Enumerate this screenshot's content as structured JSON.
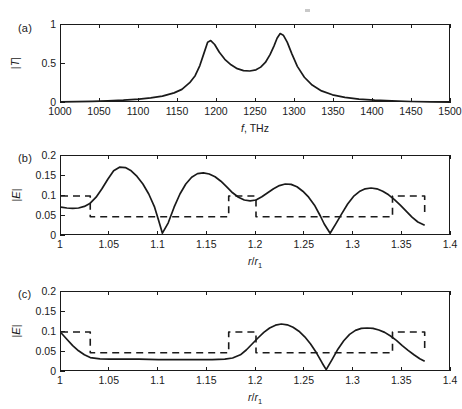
{
  "figure": {
    "panels": [
      {
        "tag": "(a)",
        "ylabel_html": "|T|",
        "xlabel_html": "f, THz"
      },
      {
        "tag": "(b)",
        "ylabel_html": "|E|",
        "xlabel_html": "r/r1"
      },
      {
        "tag": "(c)",
        "ylabel_html": "|E|",
        "xlabel_html": "r/r1"
      }
    ]
  },
  "chart_data": [
    {
      "type": "line",
      "panel": "(a)",
      "title": "",
      "xlabel": "f, THz",
      "ylabel": "|T|",
      "xlim": [
        1000,
        1500
      ],
      "ylim": [
        0,
        1
      ],
      "xticks": [
        1000,
        1050,
        1100,
        1150,
        1200,
        1250,
        1300,
        1350,
        1400,
        1450,
        1500
      ],
      "xticklabels": [
        "1000",
        "1050",
        "1100",
        "1150",
        "1200",
        "1250",
        "1300",
        "1350",
        "1400",
        "1450",
        "1500"
      ],
      "yticks": [
        0,
        0.5,
        1
      ],
      "yticklabels": [
        "0",
        "0.5",
        "1"
      ],
      "grid": false,
      "legend": null,
      "series": [
        {
          "name": "transmission",
          "style": "solid",
          "color": "#1a1a1a",
          "x": [
            1000,
            1020,
            1040,
            1060,
            1080,
            1100,
            1115,
            1130,
            1145,
            1155,
            1165,
            1172,
            1178,
            1183,
            1188,
            1192,
            1197,
            1203,
            1210,
            1218,
            1226,
            1234,
            1242,
            1250,
            1256,
            1262,
            1268,
            1273,
            1277,
            1281,
            1285,
            1290,
            1296,
            1303,
            1312,
            1322,
            1334,
            1348,
            1364,
            1382,
            1402,
            1424,
            1448,
            1474,
            1500
          ],
          "y": [
            0.015,
            0.018,
            0.022,
            0.028,
            0.036,
            0.05,
            0.065,
            0.088,
            0.13,
            0.175,
            0.26,
            0.35,
            0.48,
            0.63,
            0.78,
            0.8,
            0.75,
            0.65,
            0.56,
            0.49,
            0.44,
            0.415,
            0.41,
            0.425,
            0.46,
            0.52,
            0.62,
            0.73,
            0.83,
            0.89,
            0.87,
            0.78,
            0.63,
            0.47,
            0.33,
            0.23,
            0.155,
            0.105,
            0.072,
            0.05,
            0.036,
            0.026,
            0.019,
            0.015,
            0.012
          ]
        }
      ]
    },
    {
      "type": "line",
      "panel": "(b)",
      "title": "",
      "xlabel": "r/r1",
      "ylabel": "|E|",
      "xlim": [
        1,
        1.4
      ],
      "ylim": [
        0,
        0.2
      ],
      "xticks": [
        1,
        1.05,
        1.1,
        1.15,
        1.2,
        1.25,
        1.3,
        1.35,
        1.4
      ],
      "xticklabels": [
        "1",
        "1.05",
        "1.1",
        "1.15",
        "1.2",
        "1.25",
        "1.3",
        "1.35",
        "1.4"
      ],
      "yticks": [
        0,
        0.05,
        0.1,
        0.15,
        0.2
      ],
      "yticklabels": [
        "0",
        "0.05",
        "0.1",
        "0.15",
        "0.2"
      ],
      "grid": false,
      "legend": null,
      "series": [
        {
          "name": "field-magnitude",
          "style": "solid",
          "color": "#1a1a1a",
          "x": [
            1.0,
            1.006,
            1.012,
            1.018,
            1.024,
            1.03,
            1.036,
            1.042,
            1.048,
            1.054,
            1.06,
            1.066,
            1.072,
            1.078,
            1.084,
            1.09,
            1.096,
            1.1,
            1.104,
            1.11,
            1.116,
            1.122,
            1.128,
            1.134,
            1.14,
            1.146,
            1.152,
            1.158,
            1.164,
            1.17,
            1.176,
            1.182,
            1.188,
            1.194,
            1.2,
            1.206,
            1.212,
            1.218,
            1.224,
            1.23,
            1.236,
            1.242,
            1.248,
            1.254,
            1.26,
            1.266,
            1.27,
            1.276,
            1.282,
            1.288,
            1.294,
            1.3,
            1.306,
            1.312,
            1.318,
            1.324,
            1.33,
            1.336,
            1.342,
            1.348,
            1.354,
            1.36,
            1.366,
            1.373
          ],
          "y": [
            0.072,
            0.07,
            0.069,
            0.07,
            0.074,
            0.082,
            0.097,
            0.118,
            0.142,
            0.163,
            0.172,
            0.171,
            0.163,
            0.149,
            0.13,
            0.105,
            0.072,
            0.04,
            0.007,
            0.033,
            0.072,
            0.105,
            0.13,
            0.147,
            0.156,
            0.158,
            0.155,
            0.148,
            0.137,
            0.123,
            0.108,
            0.097,
            0.09,
            0.088,
            0.09,
            0.098,
            0.108,
            0.118,
            0.126,
            0.13,
            0.129,
            0.123,
            0.112,
            0.097,
            0.077,
            0.05,
            0.03,
            0.007,
            0.031,
            0.056,
            0.08,
            0.099,
            0.111,
            0.118,
            0.12,
            0.118,
            0.112,
            0.103,
            0.091,
            0.077,
            0.062,
            0.047,
            0.035,
            0.027
          ]
        },
        {
          "name": "index-profile",
          "style": "dashed",
          "color": "#1a1a1a",
          "x": [
            1.0,
            1.03,
            1.03,
            1.172,
            1.172,
            1.2,
            1.2,
            1.34,
            1.34,
            1.373,
            1.373
          ],
          "y": [
            0.1,
            0.1,
            0.048,
            0.048,
            0.1,
            0.1,
            0.048,
            0.048,
            0.1,
            0.1,
            0.048
          ]
        }
      ]
    },
    {
      "type": "line",
      "panel": "(c)",
      "title": "",
      "xlabel": "r/r1",
      "ylabel": "|E|",
      "xlim": [
        1,
        1.4
      ],
      "ylim": [
        0,
        0.2
      ],
      "xticks": [
        1,
        1.05,
        1.1,
        1.15,
        1.2,
        1.25,
        1.3,
        1.35,
        1.4
      ],
      "xticklabels": [
        "1",
        "1.05",
        "1.1",
        "1.15",
        "1.2",
        "1.25",
        "1.3",
        "1.35",
        "1.4"
      ],
      "yticks": [
        0,
        0.05,
        0.1,
        0.15,
        0.2
      ],
      "yticklabels": [
        "0",
        "0.05",
        "0.1",
        "0.15",
        "0.2"
      ],
      "grid": false,
      "legend": null,
      "series": [
        {
          "name": "field-magnitude",
          "style": "solid",
          "color": "#1a1a1a",
          "x": [
            1.0,
            1.006,
            1.012,
            1.018,
            1.024,
            1.03,
            1.04,
            1.05,
            1.06,
            1.08,
            1.1,
            1.12,
            1.14,
            1.155,
            1.168,
            1.176,
            1.184,
            1.19,
            1.196,
            1.202,
            1.208,
            1.214,
            1.22,
            1.226,
            1.232,
            1.238,
            1.244,
            1.25,
            1.256,
            1.262,
            1.268,
            1.272,
            1.278,
            1.284,
            1.29,
            1.296,
            1.302,
            1.308,
            1.314,
            1.32,
            1.326,
            1.332,
            1.338,
            1.344,
            1.35,
            1.356,
            1.362,
            1.368,
            1.373
          ],
          "y": [
            0.098,
            0.082,
            0.066,
            0.053,
            0.043,
            0.036,
            0.033,
            0.032,
            0.032,
            0.032,
            0.031,
            0.031,
            0.031,
            0.031,
            0.032,
            0.035,
            0.043,
            0.055,
            0.07,
            0.085,
            0.099,
            0.11,
            0.117,
            0.12,
            0.118,
            0.112,
            0.102,
            0.088,
            0.07,
            0.048,
            0.022,
            0.006,
            0.031,
            0.057,
            0.078,
            0.094,
            0.104,
            0.109,
            0.11,
            0.109,
            0.105,
            0.099,
            0.09,
            0.079,
            0.066,
            0.054,
            0.043,
            0.033,
            0.027
          ]
        },
        {
          "name": "index-profile",
          "style": "dashed",
          "color": "#1a1a1a",
          "x": [
            1.0,
            1.03,
            1.03,
            1.172,
            1.172,
            1.2,
            1.2,
            1.34,
            1.34,
            1.373,
            1.373
          ],
          "y": [
            0.1,
            0.1,
            0.048,
            0.048,
            0.1,
            0.1,
            0.048,
            0.048,
            0.1,
            0.1,
            0.048
          ]
        }
      ]
    }
  ]
}
